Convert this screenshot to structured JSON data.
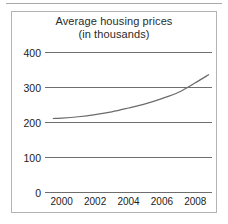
{
  "figure": {
    "background_color": "#ffffff",
    "border_color": "#b4b4b4",
    "rule_color": "#a9a9a9"
  },
  "chart_data": {
    "type": "line",
    "title": "Average housing prices",
    "subtitle": "(in thousands)",
    "xlabel": "",
    "ylabel": "",
    "xlim": [
      1999,
      2009
    ],
    "ylim": [
      0,
      400
    ],
    "grid": true,
    "legend": "none",
    "line_color": "#6b6b6b",
    "gridline_color": "#6e6e6e",
    "y_ticks": [
      0,
      100,
      200,
      300,
      400
    ],
    "y_tick_labels": [
      "0",
      "100",
      "200",
      "300",
      "400"
    ],
    "x_ticks": [
      2000,
      2002,
      2004,
      2006,
      2008
    ],
    "x_tick_labels": [
      "2000",
      "2002",
      "2004",
      "2006",
      "2008"
    ],
    "series": [
      {
        "name": "Average housing price",
        "x": [
          1999.5,
          2000,
          2001,
          2002,
          2003,
          2004,
          2005,
          2006,
          2007,
          2008,
          2008.8
        ],
        "values": [
          210,
          211,
          215,
          221,
          229,
          240,
          252,
          267,
          285,
          312,
          335
        ]
      }
    ]
  }
}
